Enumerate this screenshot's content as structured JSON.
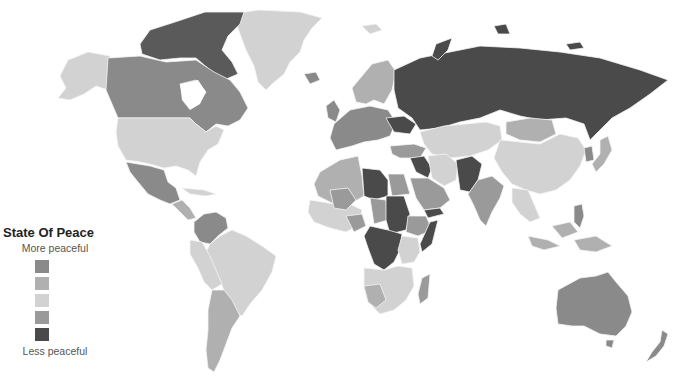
{
  "legend": {
    "title": "State Of Peace",
    "top_label": "More peaceful",
    "bottom_label": "Less peaceful",
    "swatches": [
      {
        "level": 1,
        "color": "#8a8a8a"
      },
      {
        "level": 2,
        "color": "#b0b0b0"
      },
      {
        "level": 3,
        "color": "#d2d2d2"
      },
      {
        "level": 4,
        "color": "#9a9a9a"
      },
      {
        "level": 5,
        "color": "#4a4a4a"
      }
    ]
  },
  "palette": {
    "very_high": "#8a8a8a",
    "high": "#b0b0b0",
    "medium": "#d2d2d2",
    "low": "#9a9a9a",
    "very_low": "#4a4a4a",
    "background": "#ffffff"
  }
}
